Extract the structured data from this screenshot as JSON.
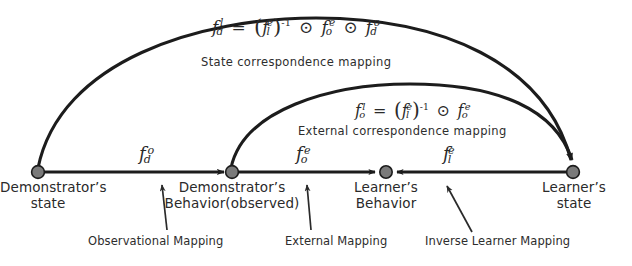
{
  "figure": {
    "type": "correspondence-mapping-diagram",
    "stroke_color": "#1c1c1c",
    "node_fill": "#7a7a7a",
    "background": "#ffffff"
  },
  "formulas": {
    "state_correspondence": {
      "lhs_f": "f",
      "lhs_sub": "d",
      "lhs_sup": "l",
      "eq": "=",
      "open_paren": "(",
      "inv_f": "f",
      "inv_sub": "l",
      "inv_sup": "e",
      "close_paren": ")",
      "inv_exp": "-1",
      "op1": "⊙",
      "t2_f": "f",
      "t2_sub": "o",
      "t2_sup": "e",
      "op2": "⊙",
      "t3_f": "f",
      "t3_sub": "d",
      "t3_sup": "o",
      "plain": "f_d^l = (f_l^e)^-1 ⊙ f_o^e ⊙ f_d^o"
    },
    "external_correspondence": {
      "lhs_f": "f",
      "lhs_sub": "o",
      "lhs_sup": "l",
      "eq": "=",
      "open_paren": "(",
      "inv_f": "f",
      "inv_sub": "l",
      "inv_sup": "e",
      "close_paren": ")",
      "inv_exp": "-1",
      "op1": "⊙",
      "t2_f": "f",
      "t2_sub": "o",
      "t2_sup": "e",
      "plain": "f_o^l = (f_l^e)^-1 ⊙ f_o^e"
    }
  },
  "arc_captions": {
    "state": "State correspondence  mapping",
    "external": "External correspondence  mapping"
  },
  "edge_functions": [
    {
      "f": "f",
      "sub": "d",
      "sup": "o",
      "plain": "f_d^o"
    },
    {
      "f": "f",
      "sub": "o",
      "sup": "e",
      "plain": "f_o^e"
    },
    {
      "f": "f",
      "sub": "l",
      "sup": "e",
      "plain": "f_l^e"
    }
  ],
  "nodes": [
    {
      "id": "demonstrator-state",
      "line1": "Demonstrator’s",
      "line2": "state"
    },
    {
      "id": "demonstrator-behavior",
      "line1": "Demonstrator’s",
      "line2": "Behavior(observed)"
    },
    {
      "id": "learner-behavior",
      "line1": "Learner’s",
      "line2": "Behavior"
    },
    {
      "id": "learner-state",
      "line1": "Learner’s",
      "line2": "state"
    }
  ],
  "annotations": [
    {
      "id": "observational-mapping",
      "label": "Observational Mapping"
    },
    {
      "id": "external-mapping",
      "label": "External Mapping"
    },
    {
      "id": "inverse-learner-mapping",
      "label": "Inverse Learner  Mapping"
    }
  ]
}
